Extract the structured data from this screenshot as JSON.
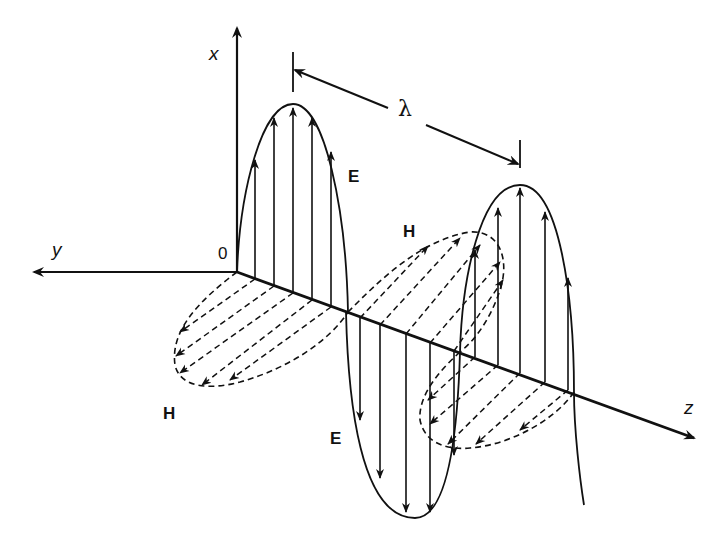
{
  "diagram": {
    "axes": {
      "x_label": "x",
      "y_label": "y",
      "z_label": "z",
      "origin_label": "0"
    },
    "fields": {
      "electric_label_1": "E",
      "electric_label_2": "E",
      "magnetic_label_1": "H",
      "magnetic_label_2": "H"
    },
    "wavelength_label": "λ",
    "colors": {
      "ink": "#111111",
      "background": "#ffffff"
    }
  }
}
